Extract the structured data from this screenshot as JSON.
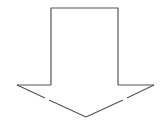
{
  "diagram": {
    "shape": "down-arrow",
    "label": "",
    "colors": {
      "stroke": "#555555",
      "fill": "#ffffff",
      "background": "#ffffff"
    },
    "geometry": {
      "shaft": {
        "left": 51,
        "right": 118,
        "top": 8,
        "bottom": 85
      },
      "head": {
        "left": 17,
        "right": 154,
        "top": 85,
        "tip_x": 86,
        "tip_y": 117
      }
    }
  }
}
